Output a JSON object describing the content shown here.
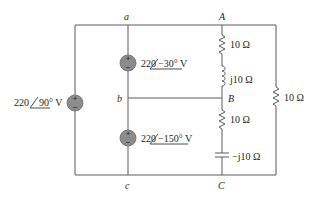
{
  "diagram": {
    "type": "circuit",
    "nodes": {
      "a": "a",
      "b": "b",
      "c": "c",
      "A": "A",
      "B": "B",
      "C": "C"
    },
    "sources": [
      {
        "id": "vs_left",
        "mag": "220",
        "angle": "90° V",
        "label_prefix": "220",
        "polarity": "+ top"
      },
      {
        "id": "vs_top",
        "mag": "220",
        "angle": "−30° V",
        "polarity": "+ top"
      },
      {
        "id": "vs_bottom",
        "mag": "220",
        "angle": "−150° V",
        "polarity": "+ top"
      }
    ],
    "components": [
      {
        "id": "r_AB",
        "type": "resistor",
        "label": "10 Ω",
        "between": "A-B"
      },
      {
        "id": "l_AB",
        "type": "inductor",
        "label": "j10 Ω",
        "between": "A-B"
      },
      {
        "id": "r_BC",
        "type": "resistor",
        "label": "10 Ω",
        "between": "B-C"
      },
      {
        "id": "c_BC",
        "type": "capacitor",
        "label": "−j10 Ω",
        "between": "B-C"
      },
      {
        "id": "r_right",
        "type": "resistor",
        "label": "10 Ω",
        "between": "A-C"
      }
    ],
    "colors": {
      "wire": "#5a5a5a",
      "source_fill": "#8c8c8c",
      "text": "#231f20"
    }
  }
}
